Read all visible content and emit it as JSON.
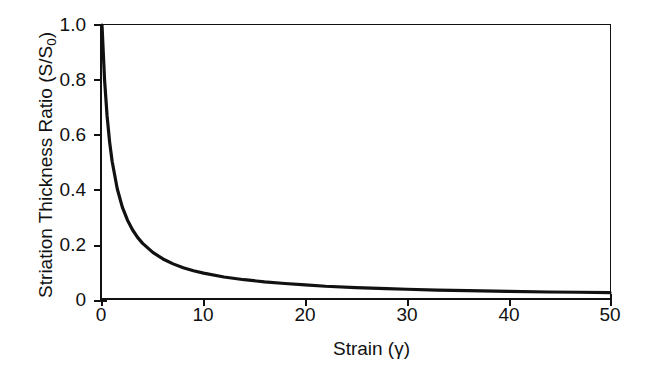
{
  "chart_data": {
    "type": "line",
    "title": "",
    "xlabel": "Strain (γ)",
    "ylabel": "Striation Thickness Ratio (S/S₀)",
    "xlabel_main": "Strain",
    "xlabel_symbol": "(γ)",
    "ylabel_main": "Striation Thickness Ratio (S/S",
    "ylabel_sub": "0",
    "ylabel_tail": ")",
    "xlim": [
      0,
      50
    ],
    "ylim": [
      0,
      1.0
    ],
    "grid": false,
    "legend": "none",
    "xticks": [
      0,
      10,
      20,
      30,
      40,
      50
    ],
    "xtick_labels": [
      "0",
      "10",
      "20",
      "30",
      "40",
      "50"
    ],
    "yticks": [
      0,
      0.2,
      0.4,
      0.6,
      0.8,
      1.0
    ],
    "ytick_labels": [
      "0",
      "0.2",
      "0.4",
      "0.6",
      "0.8",
      "1.0"
    ],
    "line_color": "#111111",
    "line_width": 3.2,
    "series": [
      {
        "name": "S/S0 = 1/(1+γ)",
        "x": [
          0,
          0.25,
          0.5,
          0.75,
          1,
          1.5,
          2,
          2.5,
          3,
          3.5,
          4,
          5,
          6,
          7,
          8,
          9,
          10,
          12,
          14,
          16,
          18,
          20,
          22,
          25,
          28,
          30,
          33,
          36,
          40,
          44,
          47,
          50
        ],
        "y": [
          1.0,
          0.8,
          0.667,
          0.571,
          0.5,
          0.4,
          0.333,
          0.286,
          0.25,
          0.222,
          0.2,
          0.167,
          0.143,
          0.125,
          0.111,
          0.1,
          0.091,
          0.077,
          0.067,
          0.059,
          0.053,
          0.048,
          0.043,
          0.038,
          0.034,
          0.032,
          0.029,
          0.027,
          0.024,
          0.022,
          0.021,
          0.02
        ]
      }
    ]
  }
}
